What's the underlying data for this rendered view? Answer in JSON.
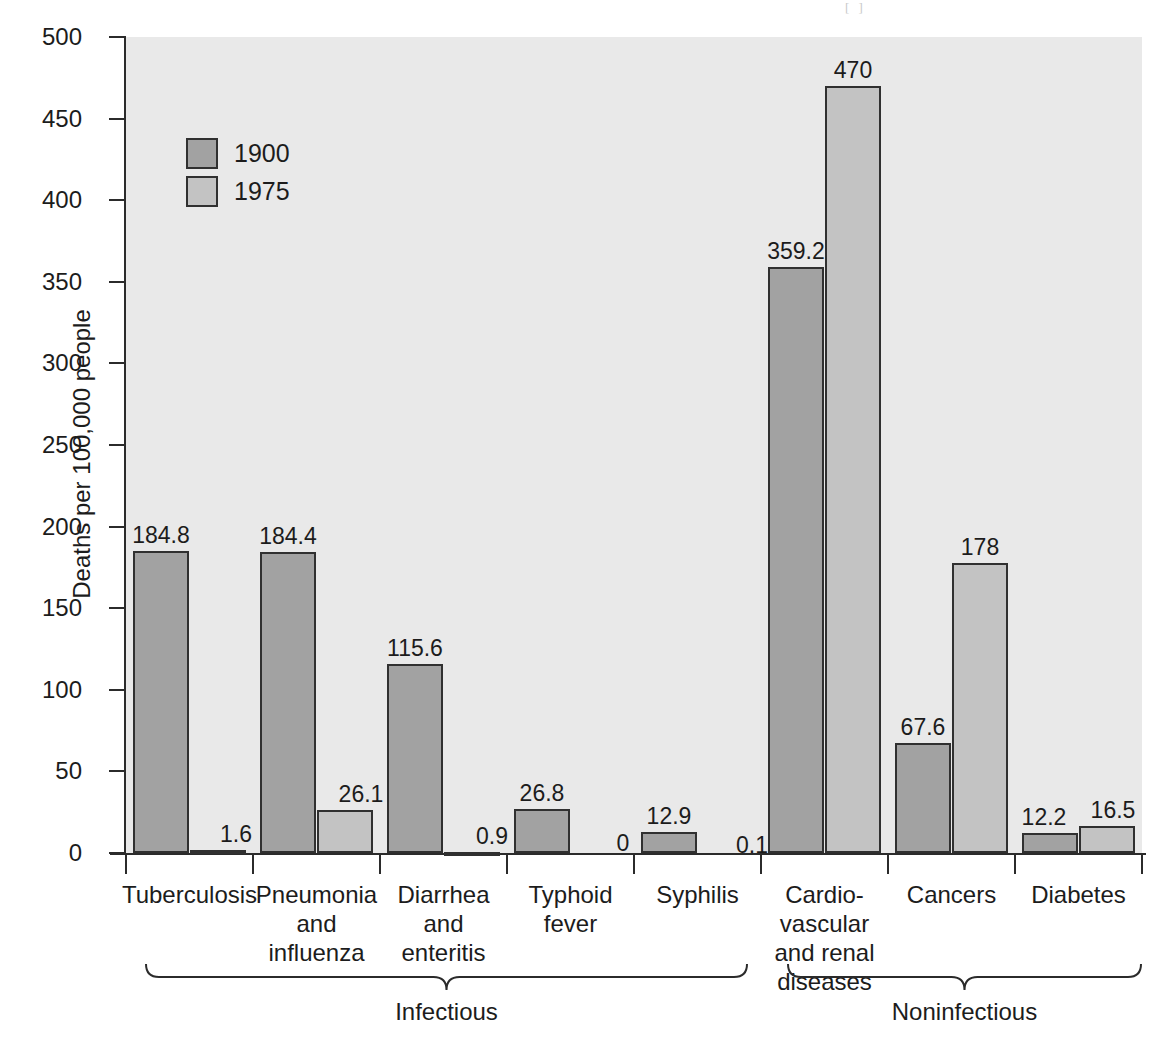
{
  "scan_artifact": "[ ]",
  "chart_data": {
    "type": "bar",
    "title": "",
    "xlabel": "",
    "ylabel": "Deaths per 100,000 people",
    "ylim": [
      0,
      500
    ],
    "ytick_values": [
      0,
      50,
      100,
      150,
      200,
      250,
      300,
      350,
      400,
      450,
      500
    ],
    "ytick_labels": [
      "0",
      "50",
      "100",
      "150",
      "200",
      "250",
      "300",
      "350",
      "400",
      "450",
      "500"
    ],
    "grid": false,
    "legend_position": "upper-left-inside",
    "categories": [
      "Tuberculosis",
      "Pneumonia\nand\ninfluenza",
      "Diarrhea\nand\nenteritis",
      "Typhoid\nfever",
      "Syphilis",
      "Cardio-\nvascular\nand renal\ndiseases",
      "Cancers",
      "Diabetes"
    ],
    "series": [
      {
        "name": "1900",
        "color": "#a2a2a2",
        "values": [
          184.8,
          184.4,
          115.6,
          26.8,
          12.9,
          359.2,
          67.6,
          12.2
        ],
        "labels": [
          "184.8",
          "184.4",
          "115.6",
          "26.8",
          "12.9",
          "359.2",
          "67.6",
          "12.2"
        ]
      },
      {
        "name": "1975",
        "color": "#c3c3c3",
        "values": [
          1.6,
          26.1,
          0.9,
          0,
          0.1,
          470,
          178,
          16.5
        ],
        "labels": [
          "1.6",
          "26.1",
          "0.9",
          "0",
          "0.1",
          "470",
          "178",
          "16.5"
        ]
      }
    ],
    "groups": [
      {
        "label": "Infectious",
        "categories": [
          "Tuberculosis",
          "Pneumonia and influenza",
          "Diarrhea and enteritis",
          "Typhoid fever",
          "Syphilis"
        ]
      },
      {
        "label": "Noninfectious",
        "categories": [
          "Cardio-vascular and renal diseases",
          "Cancers",
          "Diabetes"
        ]
      }
    ]
  },
  "legend": {
    "items": [
      {
        "label": "1900",
        "color": "#a2a2a2"
      },
      {
        "label": "1975",
        "color": "#c3c3c3"
      }
    ]
  },
  "colors": {
    "plot_background": "#e9e9e9",
    "page_background": "#ffffff",
    "axis": "#2b2b2b",
    "text": "#1c1c1c",
    "bar_1900": "#a2a2a2",
    "bar_1975": "#c3c3c3",
    "bar_outline": "#303030"
  }
}
